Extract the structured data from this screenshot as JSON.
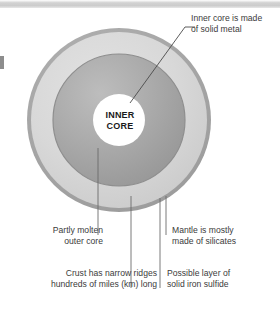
{
  "figure": {
    "background_color": "#ffffff",
    "width": 280,
    "height": 310
  },
  "top_band": {
    "name": "top-gray-band",
    "color": "#cccccc"
  },
  "diagram": {
    "center_x": 119,
    "center_y": 120,
    "layers": [
      {
        "key": "crust",
        "name": "Crust",
        "radius": 92,
        "color": "#a8a8a8"
      },
      {
        "key": "mantle",
        "name": "Mantle",
        "radius": 88,
        "color": "#d6d6d6"
      },
      {
        "key": "outer_core",
        "name": "Outer core",
        "radius": 66,
        "color": "#a9a9a9"
      },
      {
        "key": "inner_core",
        "name": "Inner core",
        "radius": 26,
        "color": "#ffffff"
      }
    ],
    "core_label_line1": "INNER",
    "core_label_line2": "CORE"
  },
  "labels": {
    "inner_core": {
      "line1": "Inner core is made",
      "line2": "of solid metal"
    },
    "outer_core": {
      "line1": "Partly molten",
      "line2": "outer core"
    },
    "mantle": {
      "line1": "Mantle is mostly",
      "line2": "made of silicates"
    },
    "crust": {
      "line1": "Crust has narrow ridges",
      "line2": "hundreds of miles (km) long"
    },
    "sulfide": {
      "line1": "Possible layer of",
      "line2": "solid iron sulfide"
    }
  },
  "leader_lines": {
    "color": "#4a4a4a",
    "inner_core_diagonal": "from inner core edge up-right to inner core label",
    "outer_core_vertical": "from outer core up-boundary down to outer core label",
    "mantle_vertical": "from mantle region down to mantle label",
    "crust_vertical": "from crust edge down to crust label",
    "sulfide_vertical": "from outer-core boundary down to sulfide label"
  }
}
